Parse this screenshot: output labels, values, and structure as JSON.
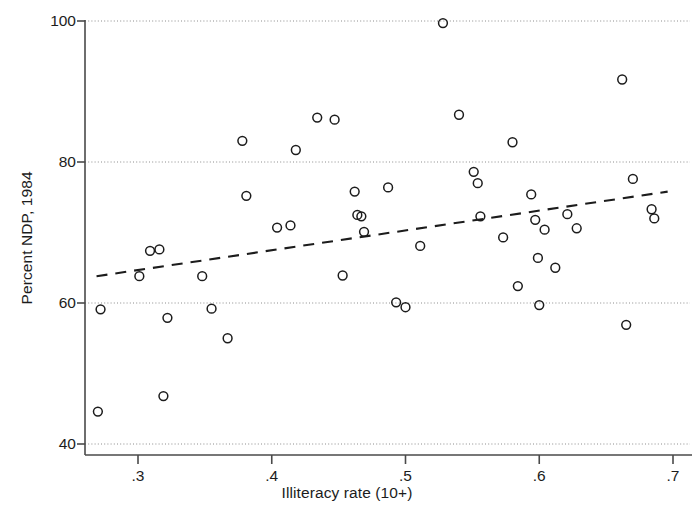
{
  "chart_data": {
    "type": "scatter",
    "title": "",
    "xlabel": "Illiteracy rate (10+)",
    "ylabel": "Percent NDP, 1984",
    "xlim": [
      0.262,
      0.695
    ],
    "ylim": [
      39.0,
      100.8
    ],
    "xticks": [
      0.3,
      0.4,
      0.5,
      0.6,
      0.7
    ],
    "xtick_labels": [
      ".3",
      ".4",
      ".5",
      ".6",
      ".7"
    ],
    "yticks": [
      40,
      60,
      80,
      100
    ],
    "ytick_labels": [
      "40",
      "60",
      "80",
      "100"
    ],
    "grid": "horizontal-dotted",
    "legend": "none",
    "marker": "open-circle",
    "marker_color": "#1c1c1c",
    "points": [
      {
        "x": 0.27,
        "y": 44.6
      },
      {
        "x": 0.272,
        "y": 59.1
      },
      {
        "x": 0.301,
        "y": 63.8
      },
      {
        "x": 0.309,
        "y": 67.4
      },
      {
        "x": 0.316,
        "y": 67.6
      },
      {
        "x": 0.319,
        "y": 46.8
      },
      {
        "x": 0.322,
        "y": 57.9
      },
      {
        "x": 0.348,
        "y": 63.8
      },
      {
        "x": 0.355,
        "y": 59.2
      },
      {
        "x": 0.367,
        "y": 55.0
      },
      {
        "x": 0.378,
        "y": 83.0
      },
      {
        "x": 0.381,
        "y": 75.2
      },
      {
        "x": 0.404,
        "y": 70.7
      },
      {
        "x": 0.414,
        "y": 71.0
      },
      {
        "x": 0.418,
        "y": 81.7
      },
      {
        "x": 0.434,
        "y": 86.3
      },
      {
        "x": 0.447,
        "y": 86.0
      },
      {
        "x": 0.453,
        "y": 63.9
      },
      {
        "x": 0.462,
        "y": 75.8
      },
      {
        "x": 0.464,
        "y": 72.5
      },
      {
        "x": 0.467,
        "y": 72.3
      },
      {
        "x": 0.469,
        "y": 70.1
      },
      {
        "x": 0.487,
        "y": 76.4
      },
      {
        "x": 0.493,
        "y": 60.1
      },
      {
        "x": 0.5,
        "y": 59.4
      },
      {
        "x": 0.511,
        "y": 68.1
      },
      {
        "x": 0.528,
        "y": 99.7
      },
      {
        "x": 0.54,
        "y": 86.7
      },
      {
        "x": 0.551,
        "y": 78.6
      },
      {
        "x": 0.554,
        "y": 77.0
      },
      {
        "x": 0.556,
        "y": 72.3
      },
      {
        "x": 0.573,
        "y": 69.3
      },
      {
        "x": 0.58,
        "y": 82.8
      },
      {
        "x": 0.584,
        "y": 62.4
      },
      {
        "x": 0.594,
        "y": 75.4
      },
      {
        "x": 0.597,
        "y": 71.8
      },
      {
        "x": 0.599,
        "y": 66.4
      },
      {
        "x": 0.6,
        "y": 59.7
      },
      {
        "x": 0.604,
        "y": 70.4
      },
      {
        "x": 0.612,
        "y": 65.0
      },
      {
        "x": 0.621,
        "y": 72.6
      },
      {
        "x": 0.628,
        "y": 70.6
      },
      {
        "x": 0.662,
        "y": 91.7
      },
      {
        "x": 0.665,
        "y": 56.9
      },
      {
        "x": 0.67,
        "y": 77.6
      },
      {
        "x": 0.684,
        "y": 73.3
      },
      {
        "x": 0.686,
        "y": 72.0
      }
    ],
    "trendline": {
      "style": "dashed",
      "color": "#1c1c1c",
      "x_start": 0.269,
      "y_start": 63.8,
      "x_end": 0.696,
      "y_end": 75.8
    }
  }
}
